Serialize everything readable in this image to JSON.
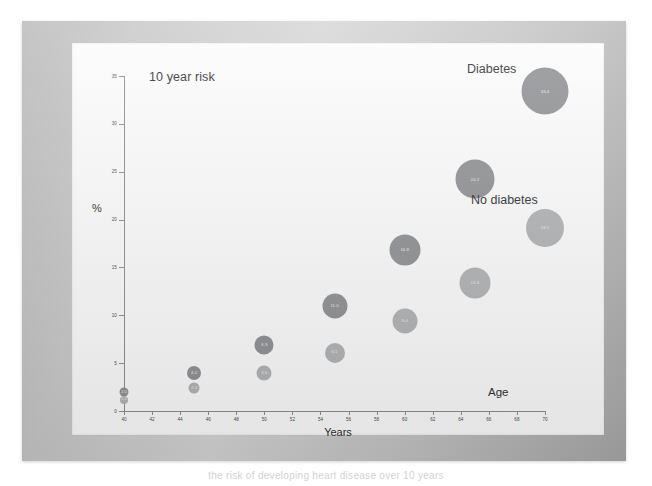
{
  "figure": {
    "frame_color": "#c4c4c4",
    "slide_color": "#fdfdfd",
    "caption_partial": "the risk of developing heart disease over 10 years"
  },
  "chart_data": {
    "type": "scatter",
    "title": "10 year risk",
    "xlabel": "Years",
    "ylabel": "%",
    "x_axis_note": "Age",
    "xlim": [
      40,
      70
    ],
    "ylim": [
      0,
      35
    ],
    "xticks": [
      40,
      42,
      44,
      46,
      48,
      50,
      52,
      54,
      56,
      58,
      60,
      62,
      64,
      66,
      68,
      70
    ],
    "yticks": [
      0,
      5,
      10,
      15,
      20,
      25,
      30,
      35
    ],
    "grid": false,
    "legend_position": "in-plot annotations",
    "series": [
      {
        "name": "Diabetes",
        "color": "#8f9093",
        "x": [
          40,
          45,
          50,
          55,
          60,
          65,
          70
        ],
        "values": [
          2.0,
          4.0,
          6.9,
          11.0,
          16.8,
          24.2,
          33.4
        ],
        "sizes": [
          9,
          14,
          19,
          25,
          31,
          39,
          47
        ],
        "labels": [
          "2.0",
          "4.0",
          "6.9",
          "11.0",
          "16.8",
          "24.2",
          "33.4"
        ]
      },
      {
        "name": "No diabetes",
        "color": "#b2b3b5",
        "x": [
          40,
          45,
          50,
          55,
          60,
          65,
          70
        ],
        "values": [
          1.2,
          2.4,
          4.0,
          6.1,
          9.4,
          13.4,
          19.1
        ],
        "sizes": [
          8,
          11,
          15,
          20,
          25,
          31,
          38
        ],
        "labels": [
          "1.2",
          "2.4",
          "4.0",
          "6.1",
          "9.4",
          "13.4",
          "19.1"
        ]
      }
    ],
    "annotations": [
      {
        "text": "Diabetes",
        "for": "Diabetes"
      },
      {
        "text": "No diabetes",
        "for": "No diabetes"
      }
    ]
  }
}
